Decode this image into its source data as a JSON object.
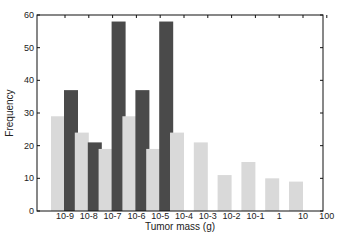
{
  "chart_data": {
    "type": "bar",
    "title": "",
    "xlabel": "Tumor mass (g)",
    "ylabel": "Frequency",
    "ylim": [
      0,
      60
    ],
    "yticks": [
      0,
      10,
      20,
      30,
      40,
      50,
      60
    ],
    "grid": false,
    "legend": null,
    "categories": [
      "10-9",
      "10-8",
      "10-7",
      "10-6",
      "10-5",
      "10-4",
      "10-3",
      "10-2",
      "10-1",
      "1",
      "10",
      "100"
    ],
    "series": [
      {
        "name": "light",
        "color": "#d9d9d9",
        "values": [
          29,
          24,
          19,
          29,
          19,
          24,
          21,
          11,
          15,
          10,
          9,
          null
        ]
      },
      {
        "name": "dark",
        "color": "#4a4a4a",
        "values": [
          37,
          21,
          58,
          37,
          58,
          null,
          null,
          null,
          null,
          null,
          null,
          null
        ]
      }
    ]
  }
}
